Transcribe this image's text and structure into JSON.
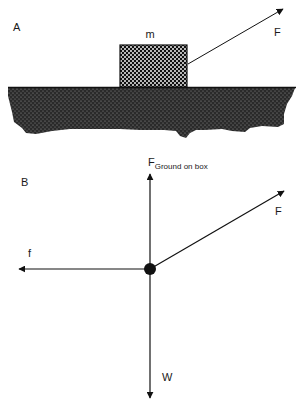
{
  "panel_a": {
    "label": "A",
    "box_label": "m",
    "force_label": "F"
  },
  "panel_b": {
    "label": "B",
    "normal_force": {
      "symbol": "F",
      "subscript": "Ground on box"
    },
    "applied_force_label": "F",
    "friction_label": "f",
    "weight_label": "W"
  },
  "colors": {
    "ink": "#111111",
    "background": "#ffffff"
  }
}
